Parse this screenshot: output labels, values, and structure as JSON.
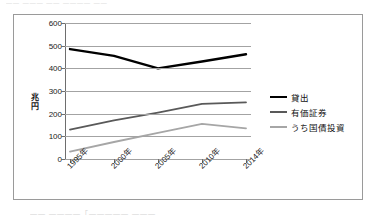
{
  "page": {
    "top_cutoff_text": "—— ——— ——  ———— ——",
    "bottom_cutoff_text": "——  ————「—————   ———"
  },
  "chart_data": {
    "type": "line",
    "title": "",
    "xlabel": "",
    "ylabel": "兆円",
    "ylim": [
      0,
      600
    ],
    "ytick_step": 100,
    "yticks": [
      0,
      100,
      200,
      300,
      400,
      500,
      600
    ],
    "grid": true,
    "legend_position": "right",
    "categories": [
      "1995年",
      "2000年",
      "2005年",
      "2010年",
      "2014年"
    ],
    "series": [
      {
        "name": "貸出",
        "color": "#000000",
        "width": 2.4,
        "values": [
          485,
          455,
          400,
          430,
          462
        ]
      },
      {
        "name": "有価証券",
        "color": "#595959",
        "width": 1.8,
        "values": [
          130,
          170,
          205,
          243,
          250
        ]
      },
      {
        "name": "うち国債投資",
        "color": "#a6a6a6",
        "width": 1.8,
        "values": [
          33,
          75,
          115,
          155,
          135
        ]
      }
    ]
  }
}
